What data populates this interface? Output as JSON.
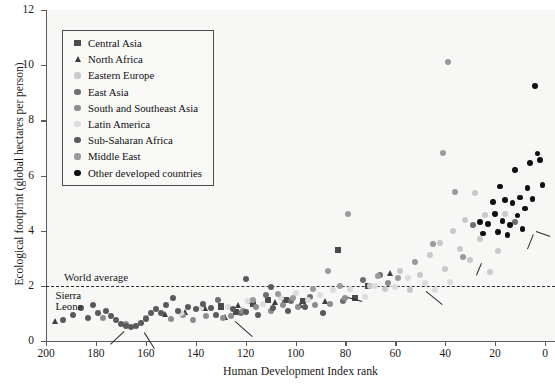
{
  "chart_data": {
    "type": "scatter",
    "title": "",
    "xlabel": "Human Development Index rank",
    "ylabel": "Ecological footprint (global hectares per person)",
    "xlim": [
      200,
      -4
    ],
    "ylim": [
      0,
      12
    ],
    "x_ticks": [
      200,
      180,
      160,
      140,
      120,
      100,
      80,
      60,
      40,
      20,
      0
    ],
    "y_ticks": [
      0,
      2,
      4,
      6,
      8,
      10,
      12
    ],
    "x_axis_reversed": true,
    "grid": false,
    "legend_position": "upper-left-inside",
    "reference_lines": [
      {
        "label": "World average",
        "axis": "y",
        "value": 2,
        "style": "dashed"
      }
    ],
    "series": [
      {
        "name": "Central Asia",
        "marker": "square",
        "color": "#4a4a4a",
        "points": [
          {
            "x": 130,
            "y": 1.25
          },
          {
            "x": 124,
            "y": 1.05
          },
          {
            "x": 117,
            "y": 1.35
          },
          {
            "x": 111,
            "y": 1.5
          },
          {
            "x": 104,
            "y": 1.5
          },
          {
            "x": 97,
            "y": 1.45
          },
          {
            "x": 83,
            "y": 3.3
          },
          {
            "x": 76,
            "y": 1.55
          },
          {
            "x": 71,
            "y": 2.0
          }
        ]
      },
      {
        "name": "North Africa",
        "marker": "triangle",
        "color": "#3d3d3d",
        "points": [
          {
            "x": 196,
            "y": 0.7
          },
          {
            "x": 152,
            "y": 0.95
          },
          {
            "x": 144,
            "y": 1.05
          },
          {
            "x": 136,
            "y": 1.2
          },
          {
            "x": 128,
            "y": 0.85
          },
          {
            "x": 123,
            "y": 1.3
          },
          {
            "x": 118,
            "y": 1.45
          },
          {
            "x": 108,
            "y": 1.4
          },
          {
            "x": 98,
            "y": 1.3
          },
          {
            "x": 88,
            "y": 1.45
          },
          {
            "x": 62,
            "y": 2.45
          }
        ]
      },
      {
        "name": "Eastern Europe",
        "marker": "circle",
        "color": "#c9c9c9",
        "points": [
          {
            "x": 70,
            "y": 2.0
          },
          {
            "x": 64,
            "y": 1.9
          },
          {
            "x": 58,
            "y": 2.55
          },
          {
            "x": 54,
            "y": 1.85
          },
          {
            "x": 50,
            "y": 2.4
          },
          {
            "x": 46,
            "y": 3.1
          },
          {
            "x": 42,
            "y": 3.55
          },
          {
            "x": 40,
            "y": 2.6
          },
          {
            "x": 37,
            "y": 4.0
          },
          {
            "x": 34,
            "y": 3.35
          },
          {
            "x": 32,
            "y": 4.4
          },
          {
            "x": 30,
            "y": 2.95
          },
          {
            "x": 28,
            "y": 5.35
          },
          {
            "x": 26,
            "y": 3.7
          },
          {
            "x": 24,
            "y": 4.55
          },
          {
            "x": 22,
            "y": 2.5
          },
          {
            "x": 19,
            "y": 3.25
          },
          {
            "x": 16,
            "y": 4.6
          }
        ]
      },
      {
        "name": "East Asia",
        "marker": "circle",
        "color": "#6e6e6e",
        "points": [
          {
            "x": 131,
            "y": 1.5
          },
          {
            "x": 122,
            "y": 1.0
          },
          {
            "x": 112,
            "y": 1.65
          },
          {
            "x": 102,
            "y": 1.45
          },
          {
            "x": 94,
            "y": 1.6
          },
          {
            "x": 81,
            "y": 1.45
          },
          {
            "x": 73,
            "y": 2.2
          },
          {
            "x": 66,
            "y": 2.4
          },
          {
            "x": 29,
            "y": 4.2
          },
          {
            "x": 12,
            "y": 4.3
          }
        ]
      },
      {
        "name": "South and Southeast Asia",
        "marker": "circle",
        "color": "#8d8d8d",
        "points": [
          {
            "x": 177,
            "y": 0.85
          },
          {
            "x": 168,
            "y": 0.6
          },
          {
            "x": 160,
            "y": 0.85
          },
          {
            "x": 150,
            "y": 0.8
          },
          {
            "x": 145,
            "y": 0.95
          },
          {
            "x": 141,
            "y": 0.75
          },
          {
            "x": 136,
            "y": 0.9
          },
          {
            "x": 129,
            "y": 0.85
          },
          {
            "x": 126,
            "y": 0.9
          },
          {
            "x": 121,
            "y": 1.1
          },
          {
            "x": 116,
            "y": 1.25
          },
          {
            "x": 110,
            "y": 1.1
          },
          {
            "x": 105,
            "y": 1.3
          },
          {
            "x": 99,
            "y": 1.25
          },
          {
            "x": 92,
            "y": 1.3
          },
          {
            "x": 86,
            "y": 1.35
          },
          {
            "x": 80,
            "y": 1.55
          },
          {
            "x": 63,
            "y": 2.1
          }
        ]
      },
      {
        "name": "Latin America",
        "marker": "circle",
        "color": "#dcdcdc",
        "points": [
          {
            "x": 146,
            "y": 1.0
          },
          {
            "x": 138,
            "y": 1.2
          },
          {
            "x": 127,
            "y": 1.25
          },
          {
            "x": 119,
            "y": 1.45
          },
          {
            "x": 113,
            "y": 1.35
          },
          {
            "x": 106,
            "y": 1.55
          },
          {
            "x": 100,
            "y": 1.75
          },
          {
            "x": 95,
            "y": 1.5
          },
          {
            "x": 90,
            "y": 1.65
          },
          {
            "x": 85,
            "y": 1.85
          },
          {
            "x": 78,
            "y": 1.9
          },
          {
            "x": 72,
            "y": 1.6
          },
          {
            "x": 68,
            "y": 2.0
          },
          {
            "x": 60,
            "y": 1.95
          },
          {
            "x": 55,
            "y": 2.3
          },
          {
            "x": 48,
            "y": 2.1
          },
          {
            "x": 44,
            "y": 1.85
          },
          {
            "x": 38,
            "y": 2.15
          }
        ]
      },
      {
        "name": "Sub-Saharan Africa",
        "marker": "circle",
        "color": "#5a5a5a",
        "points": [
          {
            "x": 193,
            "y": 0.75
          },
          {
            "x": 189,
            "y": 0.95
          },
          {
            "x": 186,
            "y": 1.2
          },
          {
            "x": 183,
            "y": 0.85
          },
          {
            "x": 181,
            "y": 1.3
          },
          {
            "x": 179,
            "y": 1.0
          },
          {
            "x": 176,
            "y": 1.1
          },
          {
            "x": 174,
            "y": 0.9
          },
          {
            "x": 172,
            "y": 0.75
          },
          {
            "x": 170,
            "y": 0.6
          },
          {
            "x": 168,
            "y": 0.55
          },
          {
            "x": 166,
            "y": 0.5
          },
          {
            "x": 164,
            "y": 0.55
          },
          {
            "x": 162,
            "y": 0.65
          },
          {
            "x": 160,
            "y": 0.8
          },
          {
            "x": 158,
            "y": 1.0
          },
          {
            "x": 156,
            "y": 1.15
          },
          {
            "x": 154,
            "y": 1.0
          },
          {
            "x": 152,
            "y": 1.3
          },
          {
            "x": 149,
            "y": 1.55
          },
          {
            "x": 147,
            "y": 1.1
          },
          {
            "x": 143,
            "y": 1.25
          },
          {
            "x": 140,
            "y": 1.15
          },
          {
            "x": 137,
            "y": 1.35
          },
          {
            "x": 134,
            "y": 1.2
          },
          {
            "x": 132,
            "y": 0.95
          },
          {
            "x": 125,
            "y": 1.15
          },
          {
            "x": 120,
            "y": 1.05
          },
          {
            "x": 115,
            "y": 0.95
          },
          {
            "x": 109,
            "y": 1.2
          },
          {
            "x": 103,
            "y": 1.1
          },
          {
            "x": 96,
            "y": 1.25
          },
          {
            "x": 89,
            "y": 1.0
          },
          {
            "x": 120,
            "y": 2.25
          },
          {
            "x": 110,
            "y": 1.95
          }
        ]
      },
      {
        "name": "Middle East",
        "marker": "circle",
        "color": "#9a9a9a",
        "points": [
          {
            "x": 117,
            "y": 1.5
          },
          {
            "x": 107,
            "y": 1.7
          },
          {
            "x": 101,
            "y": 1.55
          },
          {
            "x": 93,
            "y": 1.9
          },
          {
            "x": 87,
            "y": 2.55
          },
          {
            "x": 82,
            "y": 2.0
          },
          {
            "x": 79,
            "y": 4.6
          },
          {
            "x": 67,
            "y": 2.35
          },
          {
            "x": 59,
            "y": 2.3
          },
          {
            "x": 52,
            "y": 2.85
          },
          {
            "x": 45,
            "y": 3.5
          },
          {
            "x": 41,
            "y": 6.8
          },
          {
            "x": 39,
            "y": 10.1
          },
          {
            "x": 36,
            "y": 5.4
          },
          {
            "x": 33,
            "y": 3.05
          }
        ]
      },
      {
        "name": "Other developed countries",
        "marker": "circle",
        "color": "#101010",
        "points": [
          {
            "x": 23,
            "y": 4.25
          },
          {
            "x": 21,
            "y": 5.05
          },
          {
            "x": 20,
            "y": 4.6
          },
          {
            "x": 19,
            "y": 3.95
          },
          {
            "x": 18,
            "y": 5.6
          },
          {
            "x": 17,
            "y": 4.35
          },
          {
            "x": 16,
            "y": 5.1
          },
          {
            "x": 15,
            "y": 3.85
          },
          {
            "x": 14,
            "y": 4.2
          },
          {
            "x": 13,
            "y": 5.0
          },
          {
            "x": 12,
            "y": 6.2
          },
          {
            "x": 11,
            "y": 4.55
          },
          {
            "x": 10,
            "y": 5.2
          },
          {
            "x": 9,
            "y": 4.05
          },
          {
            "x": 8,
            "y": 4.8
          },
          {
            "x": 7,
            "y": 5.55
          },
          {
            "x": 6,
            "y": 6.45
          },
          {
            "x": 5,
            "y": 5.15
          },
          {
            "x": 4,
            "y": 9.25
          },
          {
            "x": 3,
            "y": 6.8
          },
          {
            "x": 2,
            "y": 6.55
          },
          {
            "x": 1,
            "y": 5.65
          },
          {
            "x": 25,
            "y": 3.9
          },
          {
            "x": 26,
            "y": 4.3
          }
        ]
      }
    ],
    "annotations": [
      {
        "label": "United Arab Emirates",
        "x": 39,
        "y": 10.1,
        "pos": "above"
      },
      {
        "label": "United States",
        "x": 4,
        "y": 9.25,
        "pos": "above"
      },
      {
        "label": "Kuwait",
        "x": 41,
        "y": 6.8,
        "pos": "above"
      },
      {
        "label": "Canada",
        "x": 6,
        "y": 6.45,
        "pos": "above"
      },
      {
        "label": "Australia",
        "x": 2,
        "y": 6.55,
        "pos": "right"
      },
      {
        "label": "Norway",
        "x": 1,
        "y": 5.65,
        "pos": "right"
      },
      {
        "label": "UK",
        "x": 12,
        "y": 5.3,
        "pos": "left"
      },
      {
        "label": "Ireland",
        "x": 5,
        "y": 4.0,
        "pos": "right-leader"
      },
      {
        "label": "Japan",
        "x": 7,
        "y": 3.95,
        "pos": "below-leader"
      },
      {
        "label": "Saudi Arabia",
        "x": 79,
        "y": 4.6,
        "pos": "left"
      },
      {
        "label": "South Africa",
        "x": 120,
        "y": 2.25,
        "pos": "left"
      },
      {
        "label": "Slovenia",
        "x": 26,
        "y": 2.9,
        "pos": "below-leader"
      },
      {
        "label": "Argentina",
        "x": 38,
        "y": 2.0,
        "pos": "below-leader"
      },
      {
        "label": "China",
        "x": 81,
        "y": 1.45,
        "pos": "right-leader"
      },
      {
        "label": "India",
        "x": 126,
        "y": 0.9,
        "pos": "right-leader"
      },
      {
        "label": "Sierra Leone",
        "x": 177,
        "y": 1.35,
        "pos": "left-two-line"
      },
      {
        "label": "Mozambique",
        "x": 168,
        "y": 0.55,
        "pos": "left-leader"
      },
      {
        "label": "Malawi",
        "x": 160,
        "y": 0.5,
        "pos": "below-leader"
      }
    ]
  },
  "legend": {
    "items": [
      {
        "label": "Central Asia",
        "marker": "square",
        "color": "#4a4a4a"
      },
      {
        "label": "North Africa",
        "marker": "triangle",
        "color": "#3d3d3d"
      },
      {
        "label": "Eastern Europe",
        "marker": "circle",
        "color": "#c9c9c9"
      },
      {
        "label": "East Asia",
        "marker": "circle",
        "color": "#6e6e6e"
      },
      {
        "label": "South and Southeast Asia",
        "marker": "circle",
        "color": "#8d8d8d"
      },
      {
        "label": "Latin America",
        "marker": "circle",
        "color": "#dcdcdc"
      },
      {
        "label": "Sub-Saharan Africa",
        "marker": "circle",
        "color": "#5a5a5a"
      },
      {
        "label": "Middle East",
        "marker": "circle",
        "color": "#9a9a9a"
      },
      {
        "label": "Other developed countries",
        "marker": "circle",
        "color": "#101010"
      }
    ]
  },
  "colors": {
    "background": "#ffffff",
    "plot_background": "#f7f7f6",
    "axis": "#5b5b5b",
    "text": "#111111",
    "reference_line": "#2b2b2b"
  }
}
